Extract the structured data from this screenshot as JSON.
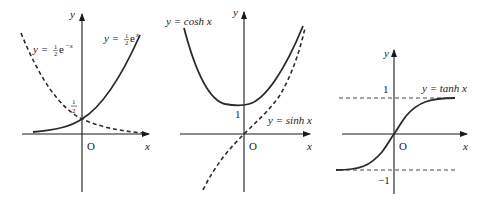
{
  "panels": [
    {
      "id": "exp",
      "y_axis_label": "y",
      "x_axis_label": "x",
      "origin_label": "O",
      "curve_solid_label_prefix": "y = ",
      "curve_solid_coef_num": "1",
      "curve_solid_coef_den": "2",
      "curve_solid_base": "e",
      "curve_solid_exp": "x",
      "curve_dashed_label_prefix": "y = ",
      "curve_dashed_coef_num": "1",
      "curve_dashed_coef_den": "2",
      "curve_dashed_base": "e",
      "curve_dashed_exp": "−x",
      "intercept_num": "1",
      "intercept_den": "2"
    },
    {
      "id": "hyperbolic",
      "y_axis_label": "y",
      "x_axis_label": "x",
      "origin_label": "O",
      "cosh_label": "y = cosh x",
      "sinh_label": "y = sinh x",
      "intercept": "1"
    },
    {
      "id": "tanh",
      "y_axis_label": "y",
      "x_axis_label": "x",
      "origin_label": "O",
      "tanh_label": "y = tanh x",
      "upper_asymptote": "1",
      "lower_asymptote": "−1"
    }
  ],
  "colors": {
    "curve": "#2a2a2a",
    "axis": "#1a1a1a"
  }
}
